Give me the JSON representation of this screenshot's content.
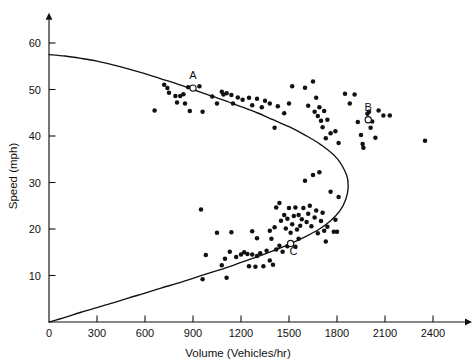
{
  "chart_data": {
    "type": "scatter",
    "title": "",
    "xlabel": "Volume (Vehicles/hr)",
    "ylabel": "Speed (mph)",
    "xlim": [
      0,
      2600
    ],
    "ylim": [
      0,
      65
    ],
    "xticks": [
      0,
      300,
      600,
      900,
      1200,
      1500,
      1800,
      2100,
      2400
    ],
    "xtick_labels": [
      "0",
      "300",
      "600",
      "900",
      "1200",
      "1500",
      "1800",
      "2100",
      "2400"
    ],
    "yticks": [
      10,
      20,
      30,
      40,
      50,
      60
    ],
    "ytick_labels": [
      "10",
      "20",
      "30",
      "40",
      "50",
      "60"
    ],
    "grid": false,
    "legend": "none",
    "curve": {
      "name": "speed-volume parabola",
      "description": "Greenshields-type parabolic speed-flow relationship; free-flow speed about 57.5 mph at zero volume, capacity about 1870 vehicles/hr at about 29 mph, congested branch returning to origin",
      "free_flow_speed": 57.5,
      "capacity_volume": 1870,
      "speed_at_capacity": 29,
      "points": [
        [
          0,
          57.5
        ],
        [
          100,
          57.2
        ],
        [
          200,
          56.7
        ],
        [
          300,
          56.1
        ],
        [
          400,
          55.3
        ],
        [
          500,
          54.4
        ],
        [
          600,
          53.4
        ],
        [
          700,
          52.3
        ],
        [
          800,
          51.2
        ],
        [
          900,
          50.0
        ],
        [
          1000,
          48.8
        ],
        [
          1100,
          47.6
        ],
        [
          1200,
          46.3
        ],
        [
          1300,
          45.0
        ],
        [
          1400,
          43.5
        ],
        [
          1500,
          42.0
        ],
        [
          1600,
          40.2
        ],
        [
          1700,
          38.1
        ],
        [
          1800,
          35.2
        ],
        [
          1860,
          31.6
        ],
        [
          1870,
          29.0
        ],
        [
          1855,
          26.4
        ],
        [
          1820,
          24.0
        ],
        [
          1760,
          21.8
        ],
        [
          1690,
          20.0
        ],
        [
          1600,
          18.3
        ],
        [
          1500,
          16.7
        ],
        [
          1400,
          15.3
        ],
        [
          1300,
          14.0
        ],
        [
          1200,
          12.8
        ],
        [
          1100,
          11.6
        ],
        [
          1000,
          10.5
        ],
        [
          900,
          9.4
        ],
        [
          800,
          8.3
        ],
        [
          700,
          7.3
        ],
        [
          600,
          6.2
        ],
        [
          500,
          5.2
        ],
        [
          400,
          4.1
        ],
        [
          300,
          3.1
        ],
        [
          200,
          2.1
        ],
        [
          100,
          1.0
        ],
        [
          0,
          0
        ]
      ]
    },
    "marked_points": [
      {
        "label": "A",
        "x": 900,
        "y": 50.3,
        "style": "open-circle",
        "label_dx": 0,
        "label_dy": -9
      },
      {
        "label": "B",
        "x": 1995,
        "y": 43.5,
        "style": "open-circle",
        "label_dx": 0,
        "label_dy": -9
      },
      {
        "label": "C",
        "x": 1510,
        "y": 16.9,
        "style": "open-circle",
        "label_dx": 3,
        "label_dy": 12
      }
    ],
    "scatter": {
      "name": "field observations",
      "marker": "filled-circle",
      "n": 128,
      "points": [
        [
          660,
          45.5
        ],
        [
          720,
          51.0
        ],
        [
          740,
          50.3
        ],
        [
          750,
          49.3
        ],
        [
          790,
          48.6
        ],
        [
          800,
          47.2
        ],
        [
          820,
          48.6
        ],
        [
          840,
          49.0
        ],
        [
          850,
          47.0
        ],
        [
          870,
          50.5
        ],
        [
          880,
          45.4
        ],
        [
          900,
          50.4
        ],
        [
          940,
          50.7
        ],
        [
          960,
          45.2
        ],
        [
          1020,
          48.5
        ],
        [
          1050,
          47.0
        ],
        [
          1080,
          49.5
        ],
        [
          1090,
          48.9
        ],
        [
          1110,
          49.2
        ],
        [
          1140,
          48.8
        ],
        [
          1150,
          47.0
        ],
        [
          1180,
          48.3
        ],
        [
          1210,
          47.8
        ],
        [
          1250,
          48.2
        ],
        [
          1270,
          46.6
        ],
        [
          1300,
          48.0
        ],
        [
          1330,
          46.2
        ],
        [
          1350,
          47.6
        ],
        [
          1380,
          47.0
        ],
        [
          1410,
          41.8
        ],
        [
          1430,
          46.4
        ],
        [
          1470,
          44.9
        ],
        [
          1500,
          47.0
        ],
        [
          1520,
          50.7
        ],
        [
          1600,
          50.4
        ],
        [
          1620,
          46.5
        ],
        [
          1650,
          51.7
        ],
        [
          1660,
          45.2
        ],
        [
          1670,
          48.2
        ],
        [
          1680,
          44.3
        ],
        [
          1690,
          46.2
        ],
        [
          1700,
          43.3
        ],
        [
          1710,
          41.9
        ],
        [
          1720,
          45.4
        ],
        [
          1730,
          39.5
        ],
        [
          1740,
          43.5
        ],
        [
          1760,
          40.6
        ],
        [
          1790,
          41.0
        ],
        [
          1810,
          38.5
        ],
        [
          1850,
          49.1
        ],
        [
          1880,
          47.0
        ],
        [
          1910,
          48.9
        ],
        [
          1930,
          43.0
        ],
        [
          1950,
          40.2
        ],
        [
          1960,
          38.3
        ],
        [
          1965,
          37.5
        ],
        [
          1990,
          44.8
        ],
        [
          2000,
          45.2
        ],
        [
          2010,
          41.8
        ],
        [
          2020,
          43.1
        ],
        [
          2040,
          39.6
        ],
        [
          2060,
          45.5
        ],
        [
          2090,
          44.4
        ],
        [
          2130,
          44.4
        ],
        [
          2350,
          39.0
        ],
        [
          950,
          24.2
        ],
        [
          1050,
          19.2
        ],
        [
          1140,
          19.3
        ],
        [
          1270,
          19.5
        ],
        [
          1300,
          18.0
        ],
        [
          1380,
          19.6
        ],
        [
          1390,
          17.9
        ],
        [
          1410,
          20.4
        ],
        [
          1420,
          24.6
        ],
        [
          1440,
          25.6
        ],
        [
          1450,
          21.8
        ],
        [
          1470,
          23.0
        ],
        [
          1480,
          20.1
        ],
        [
          1490,
          22.2
        ],
        [
          1500,
          24.5
        ],
        [
          1510,
          19.2
        ],
        [
          1520,
          21.0
        ],
        [
          1530,
          22.8
        ],
        [
          1540,
          24.6
        ],
        [
          1550,
          19.9
        ],
        [
          1560,
          23.0
        ],
        [
          1570,
          20.7
        ],
        [
          1580,
          22.1
        ],
        [
          1590,
          24.5
        ],
        [
          1600,
          30.4
        ],
        [
          1610,
          21.5
        ],
        [
          1620,
          23.3
        ],
        [
          1630,
          25.0
        ],
        [
          1640,
          20.6
        ],
        [
          1650,
          31.6
        ],
        [
          1660,
          22.5
        ],
        [
          1670,
          24.0
        ],
        [
          1680,
          19.1
        ],
        [
          1690,
          32.2
        ],
        [
          1700,
          21.7
        ],
        [
          1710,
          23.5
        ],
        [
          1720,
          19.6
        ],
        [
          1730,
          17.3
        ],
        [
          1740,
          20.5
        ],
        [
          1760,
          28.0
        ],
        [
          1780,
          19.4
        ],
        [
          1790,
          22.0
        ],
        [
          1800,
          19.4
        ],
        [
          1810,
          26.9
        ],
        [
          960,
          9.2
        ],
        [
          980,
          14.4
        ],
        [
          1080,
          12.2
        ],
        [
          1100,
          13.6
        ],
        [
          1110,
          9.5
        ],
        [
          1130,
          15.1
        ],
        [
          1170,
          14.0
        ],
        [
          1200,
          14.5
        ],
        [
          1220,
          15.0
        ],
        [
          1240,
          14.6
        ],
        [
          1250,
          12.0
        ],
        [
          1270,
          14.5
        ],
        [
          1290,
          11.9
        ],
        [
          1300,
          14.2
        ],
        [
          1320,
          14.8
        ],
        [
          1340,
          12.0
        ],
        [
          1360,
          15.3
        ],
        [
          1380,
          13.2
        ],
        [
          1400,
          12.3
        ],
        [
          1420,
          15.6
        ],
        [
          1440,
          16.4
        ],
        [
          1460,
          15.1
        ],
        [
          1490,
          16.3
        ],
        [
          1540,
          16.2
        ],
        [
          1560,
          17.9
        ]
      ]
    }
  },
  "axes": {
    "x_axis_name": "volume-axis",
    "y_axis_name": "speed-axis"
  }
}
